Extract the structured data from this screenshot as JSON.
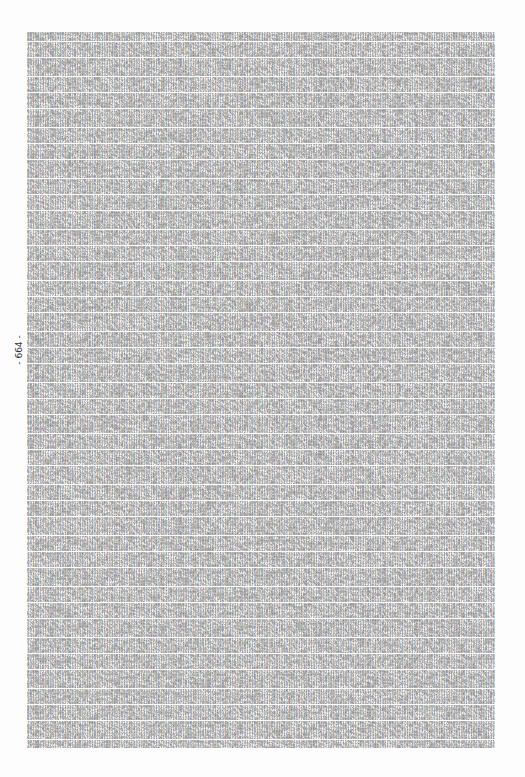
{
  "page": {
    "page_number_label": "- 664 -",
    "content_description": "Dense block of decimal digits filling the page",
    "line_count": 225,
    "chars_per_line": 190,
    "seed_digits": "2911750629229345305856471966781993630435461327007838080358097381864953913679186605182447906074403415822808855416201766177256795976823866806550585690166603553261751618490723"
  }
}
